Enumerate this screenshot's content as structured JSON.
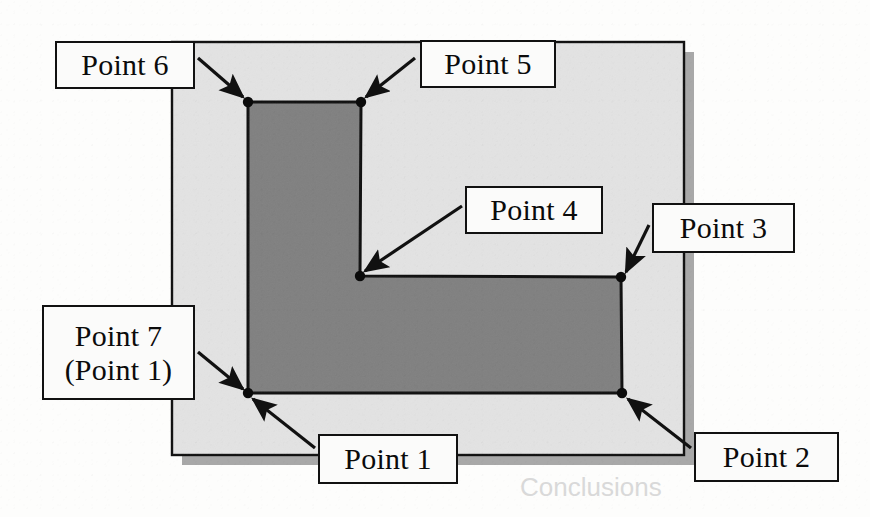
{
  "figure": {
    "type": "technical-diagram",
    "colors": {
      "page_background": "#fdfdfc",
      "slide_fill": "#e3e3e3",
      "slide_shadow": "#a8a8a8",
      "polygon_fill": "#808080",
      "outline": "#111111",
      "label_fill": "#fbfbfa"
    }
  },
  "slide": {
    "name": "background-slide",
    "x": 172,
    "y": 42,
    "width": 512,
    "height": 413,
    "shadow_offset": 10
  },
  "polygon": {
    "name": "l-shaped-polygon",
    "points": "248,102 361,102 360,276 621,277 622,393 248,393",
    "vertices": [
      {
        "id": "p6",
        "label": "Point 6",
        "x": 248,
        "y": 102
      },
      {
        "id": "p5",
        "label": "Point 5",
        "x": 361,
        "y": 102
      },
      {
        "id": "p4",
        "label": "Point 4",
        "x": 360,
        "y": 276
      },
      {
        "id": "p3",
        "label": "Point 3",
        "x": 621,
        "y": 277
      },
      {
        "id": "p2",
        "label": "Point 2",
        "x": 622,
        "y": 393
      },
      {
        "id": "p1",
        "label": "Point 1",
        "x": 248,
        "y": 393
      }
    ]
  },
  "labels": [
    {
      "id": "point-6",
      "text": "Point 6",
      "sub": "",
      "box": {
        "x": 55,
        "y": 41,
        "width": 140,
        "height": 48
      },
      "arrow": {
        "x1": 198,
        "y1": 58,
        "x2": 243,
        "y2": 97
      }
    },
    {
      "id": "point-5",
      "text": "Point 5",
      "sub": "",
      "box": {
        "x": 420,
        "y": 40,
        "width": 136,
        "height": 48
      },
      "arrow": {
        "x1": 415,
        "y1": 58,
        "x2": 366,
        "y2": 97
      }
    },
    {
      "id": "point-4",
      "text": "Point 4",
      "sub": "",
      "box": {
        "x": 465,
        "y": 186,
        "width": 138,
        "height": 48
      },
      "arrow": {
        "x1": 462,
        "y1": 206,
        "x2": 365,
        "y2": 271
      }
    },
    {
      "id": "point-3",
      "text": "Point 3",
      "sub": "",
      "box": {
        "x": 652,
        "y": 203,
        "width": 143,
        "height": 50
      },
      "arrow": {
        "x1": 649,
        "y1": 225,
        "x2": 626,
        "y2": 272
      }
    },
    {
      "id": "point-7",
      "text": "Point 7",
      "sub": "(Point 1)",
      "box": {
        "x": 42,
        "y": 305,
        "width": 153,
        "height": 95
      },
      "arrow": {
        "x1": 198,
        "y1": 352,
        "x2": 243,
        "y2": 389
      }
    },
    {
      "id": "point-1",
      "text": "Point 1",
      "sub": "",
      "box": {
        "x": 318,
        "y": 434,
        "width": 140,
        "height": 50
      },
      "arrow": {
        "x1": 315,
        "y1": 448,
        "x2": 253,
        "y2": 399
      }
    },
    {
      "id": "point-2",
      "text": "Point 2",
      "sub": "",
      "box": {
        "x": 694,
        "y": 432,
        "width": 145,
        "height": 50
      },
      "arrow": {
        "x1": 691,
        "y1": 448,
        "x2": 628,
        "y2": 399
      }
    }
  ],
  "ghost_text": {
    "top": "",
    "bottom": "Conclusions"
  }
}
